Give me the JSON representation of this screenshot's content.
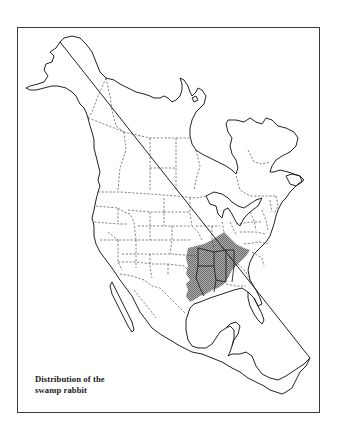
{
  "figure": {
    "caption_line1": "Distribution of the",
    "caption_line2": "swamp rabbit",
    "caption_full": "Distribution of the swamp rabbit",
    "map_extent": "North America (Alaska and Canada to Central America)",
    "range_fill_color": "#9a9a9a",
    "outline_color": "#222222",
    "border_style": "dashed state/provincial boundaries",
    "range_description": "South-central United States: eastern Texas and Oklahoma, Arkansas, Louisiana, Mississippi, Alabama, western Tennessee and Kentucky, southern Missouri/Illinois/Indiana, northwest Georgia and western South Carolina"
  },
  "map_data": {
    "type": "range_map",
    "shaded_region_label": "swamp rabbit range",
    "shaded_states": [
      "Texas (east)",
      "Oklahoma (east)",
      "Arkansas",
      "Louisiana",
      "Mississippi",
      "Alabama",
      "Tennessee",
      "Kentucky (west)",
      "Missouri (south-east)",
      "Illinois (south)",
      "Indiana (south)",
      "Georgia (north-west)",
      "South Carolina (west)"
    ]
  }
}
